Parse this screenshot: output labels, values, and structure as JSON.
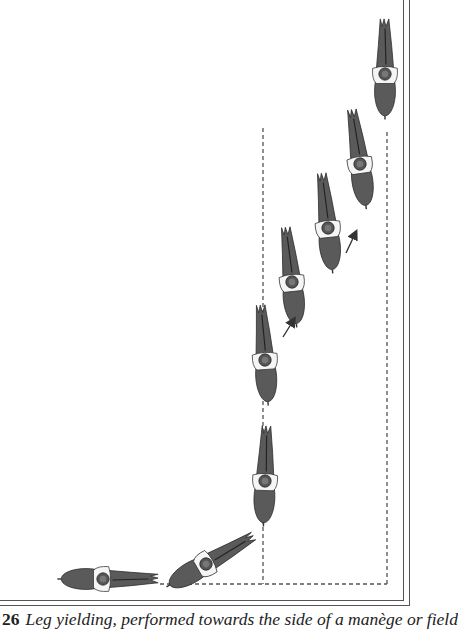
{
  "figure": {
    "number": "26",
    "caption": "Leg yielding, performed towards the side of a manège or field",
    "illustration": "leg-yielding-horse-and-rider-sequence",
    "colors": {
      "horse_fill": "#5a5a5a",
      "outline": "#2a2a2a",
      "dash_line": "#555555",
      "frame": "#555555"
    },
    "horse_count": 8,
    "arrow_count": 2
  }
}
